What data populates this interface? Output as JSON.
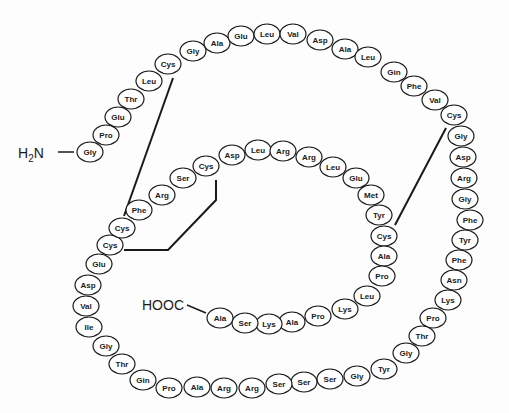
{
  "diagram": {
    "type": "peptide-chain",
    "n_terminus": {
      "label_main": "H",
      "label_sub": "2",
      "label_end": "N",
      "x": 18,
      "y": 158,
      "line": [
        58,
        152,
        74,
        152
      ]
    },
    "c_terminus": {
      "label": "HOOC",
      "x": 142,
      "y": 310,
      "line": [
        187,
        305,
        206,
        313
      ]
    },
    "residues": [
      {
        "name": "Gly",
        "x": 90,
        "y": 152
      },
      {
        "name": "Pro",
        "x": 106,
        "y": 135
      },
      {
        "name": "Glu",
        "x": 118,
        "y": 117
      },
      {
        "name": "Thr",
        "x": 131,
        "y": 99
      },
      {
        "name": "Leu",
        "x": 149,
        "y": 81
      },
      {
        "name": "Cys",
        "x": 168,
        "y": 64
      },
      {
        "name": "Gly",
        "x": 193,
        "y": 51
      },
      {
        "name": "Ala",
        "x": 217,
        "y": 43
      },
      {
        "name": "Glu",
        "x": 241,
        "y": 36
      },
      {
        "name": "Leu",
        "x": 267,
        "y": 34
      },
      {
        "name": "Val",
        "x": 293,
        "y": 34
      },
      {
        "name": "Asp",
        "x": 320,
        "y": 40
      },
      {
        "name": "Ala",
        "x": 345,
        "y": 49
      },
      {
        "name": "Leu",
        "x": 368,
        "y": 57
      },
      {
        "name": "Gin",
        "x": 394,
        "y": 72
      },
      {
        "name": "Phe",
        "x": 414,
        "y": 86
      },
      {
        "name": "Val",
        "x": 435,
        "y": 100
      },
      {
        "name": "Cys",
        "x": 454,
        "y": 115
      },
      {
        "name": "Gly",
        "x": 461,
        "y": 136
      },
      {
        "name": "Asp",
        "x": 463,
        "y": 157
      },
      {
        "name": "Arg",
        "x": 464,
        "y": 178
      },
      {
        "name": "Gly",
        "x": 465,
        "y": 199
      },
      {
        "name": "Phe",
        "x": 470,
        "y": 220
      },
      {
        "name": "Tyr",
        "x": 465,
        "y": 240
      },
      {
        "name": "Phe",
        "x": 459,
        "y": 260
      },
      {
        "name": "Asn",
        "x": 454,
        "y": 280
      },
      {
        "name": "Lys",
        "x": 448,
        "y": 300
      },
      {
        "name": "Pro",
        "x": 433,
        "y": 318
      },
      {
        "name": "Thr",
        "x": 422,
        "y": 336
      },
      {
        "name": "Gly",
        "x": 406,
        "y": 353
      },
      {
        "name": "Tyr",
        "x": 384,
        "y": 369
      },
      {
        "name": "Gly",
        "x": 357,
        "y": 376
      },
      {
        "name": "Ser",
        "x": 330,
        "y": 379
      },
      {
        "name": "Ser",
        "x": 304,
        "y": 382
      },
      {
        "name": "Ser",
        "x": 279,
        "y": 384
      },
      {
        "name": "Arg",
        "x": 252,
        "y": 388
      },
      {
        "name": "Arg",
        "x": 224,
        "y": 388
      },
      {
        "name": "Ala",
        "x": 197,
        "y": 387
      },
      {
        "name": "Pro",
        "x": 169,
        "y": 388
      },
      {
        "name": "Gin",
        "x": 143,
        "y": 380
      },
      {
        "name": "Thr",
        "x": 122,
        "y": 364
      },
      {
        "name": "Gly",
        "x": 106,
        "y": 346
      },
      {
        "name": "Ile",
        "x": 89,
        "y": 327
      },
      {
        "name": "Val",
        "x": 86,
        "y": 306
      },
      {
        "name": "Asp",
        "x": 88,
        "y": 285
      },
      {
        "name": "Glu",
        "x": 99,
        "y": 264
      },
      {
        "name": "Cys",
        "x": 110,
        "y": 245
      },
      {
        "name": "Cys",
        "x": 122,
        "y": 228
      },
      {
        "name": "Phe",
        "x": 139,
        "y": 210
      },
      {
        "name": "Arg",
        "x": 162,
        "y": 195
      },
      {
        "name": "Ser",
        "x": 183,
        "y": 178
      },
      {
        "name": "Cys",
        "x": 206,
        "y": 166
      },
      {
        "name": "Asp",
        "x": 232,
        "y": 155
      },
      {
        "name": "Leu",
        "x": 258,
        "y": 150
      },
      {
        "name": "Arg",
        "x": 283,
        "y": 151
      },
      {
        "name": "Arg",
        "x": 309,
        "y": 157
      },
      {
        "name": "Leu",
        "x": 333,
        "y": 167
      },
      {
        "name": "Glu",
        "x": 356,
        "y": 178
      },
      {
        "name": "Met",
        "x": 371,
        "y": 195
      },
      {
        "name": "Tyr",
        "x": 379,
        "y": 215
      },
      {
        "name": "Cys",
        "x": 384,
        "y": 236
      },
      {
        "name": "Ala",
        "x": 384,
        "y": 256
      },
      {
        "name": "Pro",
        "x": 382,
        "y": 276
      },
      {
        "name": "Leu",
        "x": 367,
        "y": 296
      },
      {
        "name": "Lys",
        "x": 345,
        "y": 309
      },
      {
        "name": "Pro",
        "x": 318,
        "y": 316
      },
      {
        "name": "Ala",
        "x": 292,
        "y": 322
      },
      {
        "name": "Lys",
        "x": 269,
        "y": 324
      },
      {
        "name": "Ser",
        "x": 245,
        "y": 323
      },
      {
        "name": "Ala",
        "x": 220,
        "y": 318
      }
    ],
    "disulfide_bonds": [
      {
        "points": "173,78 124,216"
      },
      {
        "points": "216,180 216,200 168,250 124,250"
      },
      {
        "points": "446,128 395,225"
      }
    ]
  }
}
